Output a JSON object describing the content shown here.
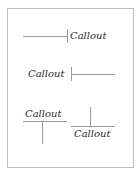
{
  "diagram": {
    "callouts": [
      {
        "label": "Callout",
        "style": "line-left-tick"
      },
      {
        "label": "Callout",
        "style": "line-right-tick"
      },
      {
        "label": "Callout",
        "style": "underline-drop-down"
      },
      {
        "label": "Callout",
        "style": "overline-rise-up"
      }
    ]
  }
}
